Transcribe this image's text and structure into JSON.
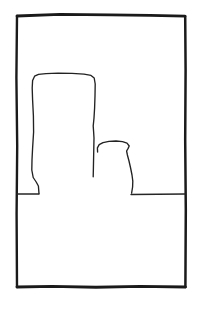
{
  "artwork": {
    "title": "Untitled line drawing",
    "medium": "ink line sketch",
    "background_color": "#ffffff",
    "ink_color": "#1a1a1a",
    "canvas": {
      "width": 202,
      "height": 314
    }
  },
  "frame": {
    "name": "hand-drawn rectangular border",
    "color": "#1a1a1a",
    "left": 16,
    "top": 14,
    "right": 186,
    "bottom": 287,
    "stroke_width": 2.6,
    "top_edge": "M 17 16 L 60 14.4 L 110 14.8 L 150 15.4 L 185 16.2",
    "right_edge": "M 185.2 16.2 L 185.6 70 L 185.2 140 L 185.8 210 L 185.4 287",
    "bottom_edge": "M 185.4 287 L 140 286.4 L 96 287.2 L 52 286.4 L 17 287",
    "left_edge": "M 17 287 L 16.6 214 L 17.2 146 L 16.4 78 L 17 16"
  },
  "ground_line": {
    "name": "horizontal ground line",
    "y": 194,
    "left_segment": {
      "x_start": 17,
      "x_end": 39
    },
    "right_segment": {
      "x_start": 131,
      "x_end": 185
    },
    "color": "#262626"
  },
  "shapes": [
    {
      "id": "large-block",
      "name": "large rectangular block",
      "description": "tall slightly bowed rectangular form on the left",
      "bounds": {
        "left": 31,
        "top": 73,
        "right": 96,
        "bottom": 194
      },
      "color": "#222222",
      "path": "M 39.0 193.6 L 38.4 186.0 L 36.2 182.0 L 33.2 177.5 L 31.8 170.0 L 32.0 160.0 L 32.6 148.0 L 33.6 132.0 L 33.4 116.0 L 32.6 100.0 L 32.2 88.0 L 32.6 80.5 L 34.6 76.2 L 38.5 74.4 L 46.0 73.6 L 58.0 73.2 L 72.0 73.4 L 84.0 74.2 L 91.0 75.4 L 94.2 78.0 L 95.2 84.0 L 95.0 96.0 L 94.6 108.0 L 94.0 118.0 L 93.2 126.0 L 93.6 131.5 L 94.0 138.0 L 93.8 148.0 L 93.6 158.0 L 93.4 168.0 L 93.2 176.8"
    },
    {
      "id": "vase",
      "name": "small jar or vase form",
      "description": "short rounded vessel with flared rim to the right of the block",
      "bounds": {
        "left": 97,
        "top": 141,
        "right": 134,
        "bottom": 194
      },
      "color": "#222222",
      "path": "M 97.6 152.0 L 97.4 147.8 L 99.2 144.6 L 103.0 142.6 L 109.0 141.4 L 116.0 141.0 L 122.5 141.6 L 127.0 143.2 L 129.2 146.0 L 128.0 148.6 L 126.6 151.0 L 127.4 155.0 L 129.0 161.0 L 130.6 168.0 L 132.0 175.0 L 132.8 181.0 L 132.6 187.0 L 131.6 193.2"
    }
  ],
  "caption": {
    "text": "",
    "visible": false
  }
}
